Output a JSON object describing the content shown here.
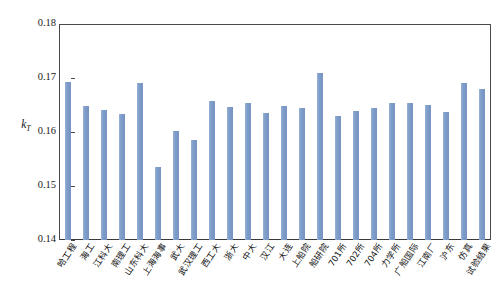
{
  "chart_data": {
    "type": "bar",
    "title": "",
    "subtitle": "",
    "xlabel": "",
    "ylabel": "k_T",
    "ylabel_base": "k",
    "ylabel_sub": "T",
    "ylim": [
      0.14,
      0.18
    ],
    "ytick_labels": [
      "0.18",
      "0.17",
      "0.16",
      "0.15",
      "0.14"
    ],
    "ytick_values": [
      0.18,
      0.17,
      0.16,
      0.15,
      0.14
    ],
    "grid": false,
    "legend": "none",
    "series_name": "kT",
    "bar_color": "#7e9dca",
    "axis_color": "#4a4a4a",
    "categories": [
      "哈工程",
      "海工",
      "江科大",
      "南理工",
      "山东科大",
      "上海海事",
      "武大",
      "武汉理工",
      "西工大",
      "浙大",
      "中大",
      "汉江",
      "大连",
      "上船院",
      "船研院",
      "701所",
      "702所",
      "704所",
      "力学所",
      "广船国际",
      "江南厂",
      "沪东",
      "仿真",
      "试验结果"
    ],
    "values": [
      0.1693,
      0.1648,
      0.164,
      0.1633,
      0.169,
      0.1535,
      0.1601,
      0.1585,
      0.1658,
      0.1646,
      0.1653,
      0.1636,
      0.1648,
      0.1644,
      0.171,
      0.1629,
      0.1638,
      0.1645,
      0.1654,
      0.1653,
      0.165,
      0.1637,
      0.169,
      0.168
    ]
  }
}
